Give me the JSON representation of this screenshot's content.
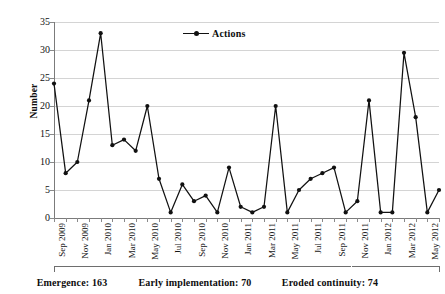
{
  "chart_data": {
    "type": "line",
    "title": "",
    "xlabel": "",
    "ylabel": "Number",
    "ylim": [
      0,
      35
    ],
    "ytick_step": 5,
    "yticks": [
      0,
      5,
      10,
      15,
      20,
      25,
      30,
      35
    ],
    "grid": true,
    "legend_position": "top-center",
    "legend": [
      "Actions"
    ],
    "series": [
      {
        "name": "Actions",
        "values": [
          24,
          8,
          10,
          21,
          33,
          13,
          14,
          12,
          20,
          7,
          1,
          6,
          3,
          4,
          1,
          9,
          2,
          1,
          2,
          20,
          1,
          5,
          7,
          8,
          9,
          1,
          3,
          21,
          1,
          1,
          29.5,
          18,
          1,
          5
        ]
      }
    ],
    "categories": [
      "Sep 2009",
      "Oct 2009",
      "Nov 2009",
      "Dec 2009",
      "Jan 2010",
      "Feb 2010",
      "Mar 2010",
      "Apr 2010",
      "May 2010",
      "Jun 2010",
      "Jul 2010",
      "Aug 2010",
      "Sep 2010",
      "Oct 2010",
      "Nov 2010",
      "Dec 2010",
      "Jan 2011",
      "Feb 2011",
      "Mar 2011",
      "Apr 2011",
      "May 2011",
      "Jun 2011",
      "Jul 2011",
      "Aug 2011",
      "Sep 2011",
      "Oct 2011",
      "Nov 2011",
      "Dec 2011",
      "Jan 2012",
      "Feb 2012",
      "Mar 2012",
      "Apr 2012",
      "May 2012",
      "Jun 2012"
    ],
    "tick_labels": [
      "Sep 2009",
      "Nov 2009",
      "Jan 2010",
      "Mar 2010",
      "May 2010",
      "Jul 2010",
      "Sep 2010",
      "Nov 2010",
      "Jan 2011",
      "Mar 2011",
      "May 2011",
      "Jul 2011",
      "Sep 2011",
      "Nov 2011",
      "Jan 2012",
      "Mar 2012",
      "May 2012"
    ],
    "tick_label_indices": [
      0,
      2,
      4,
      6,
      8,
      10,
      12,
      14,
      16,
      18,
      20,
      22,
      24,
      26,
      28,
      30,
      32
    ],
    "annotations": [
      {
        "label": "Emergence: 163",
        "name": "Emergence",
        "value": 163,
        "start_index": 0,
        "end_index": 11
      },
      {
        "label": "Early implementation: 70",
        "name": "Early implementation",
        "value": 70,
        "start_index": 12,
        "end_index": 25
      },
      {
        "label": "Eroded continuity: 74",
        "name": "Eroded continuity",
        "value": 74,
        "start_index": 26,
        "end_index": 33
      }
    ],
    "colors": {
      "line": "#111111",
      "marker": "#111111",
      "grid": "#d4d4d4",
      "axis": "#7b7b7b",
      "background": "#ffffff"
    }
  }
}
